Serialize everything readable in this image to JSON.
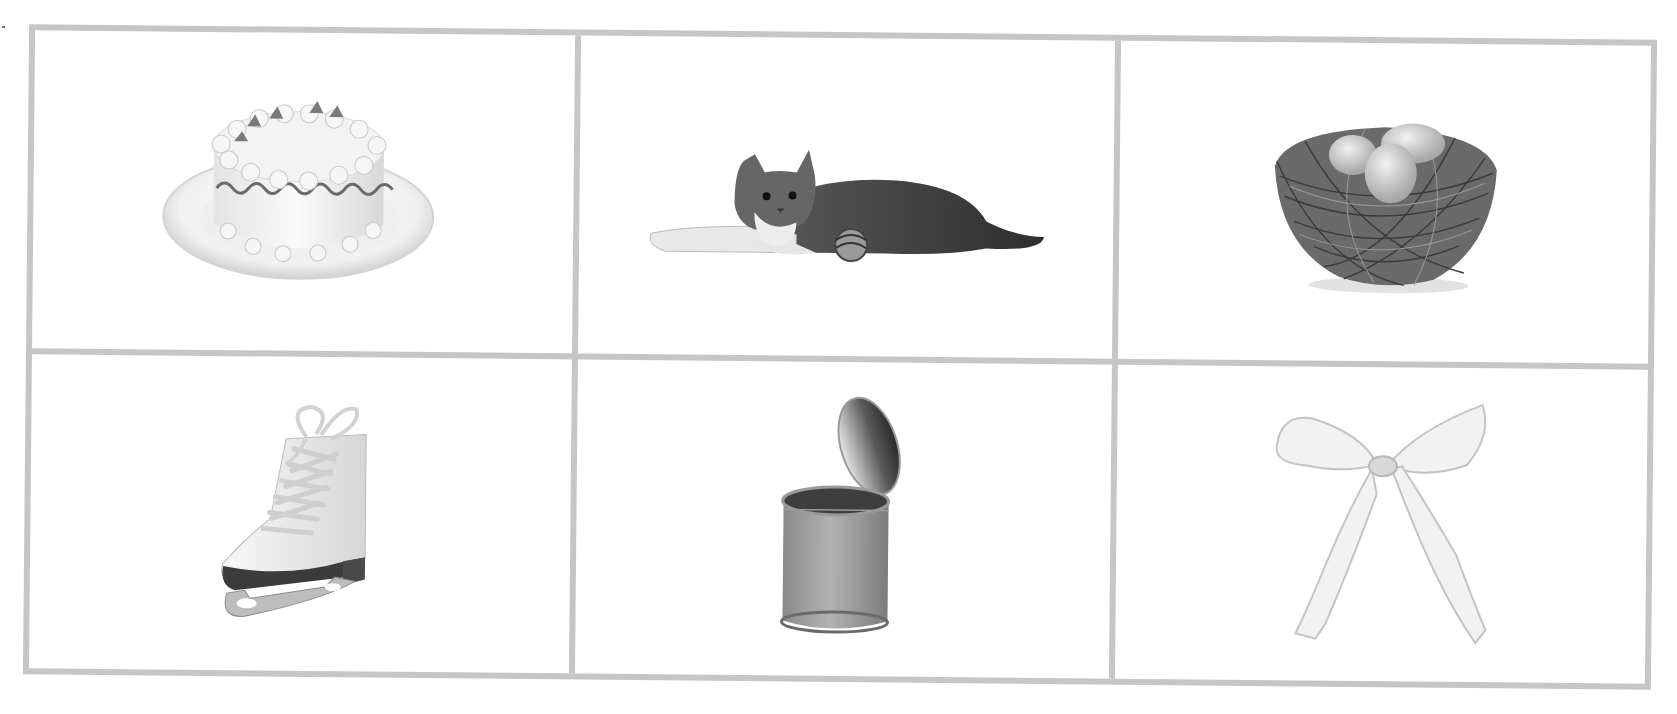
{
  "worksheet": {
    "layout": "3x2 picture grid",
    "border_color": "#c6c6c6",
    "cells": [
      {
        "label": "cake",
        "icon": "cake-icon"
      },
      {
        "label": "cat",
        "icon": "cat-icon"
      },
      {
        "label": "nest",
        "icon": "nest-icon"
      },
      {
        "label": "skate",
        "icon": "skate-icon"
      },
      {
        "label": "can",
        "icon": "can-icon"
      },
      {
        "label": "bow",
        "icon": "bow-icon"
      }
    ]
  }
}
